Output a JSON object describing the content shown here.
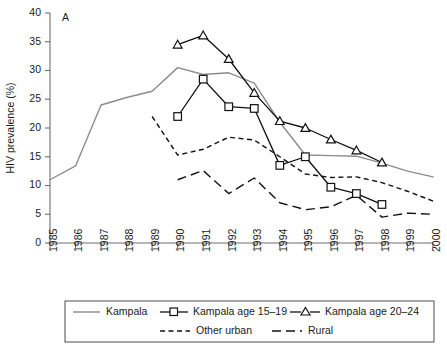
{
  "panel": {
    "label": "A"
  },
  "chart_data": {
    "type": "line",
    "title": "",
    "subtitle": "",
    "xlabel": "",
    "ylabel": "HIV prevalence (%)",
    "xlim": [
      1985,
      2000
    ],
    "ylim": [
      0,
      40
    ],
    "yticks": [
      0,
      5,
      10,
      15,
      20,
      25,
      30,
      35,
      40
    ],
    "ytick_labels": [
      "0",
      "5",
      "10",
      "15",
      "20",
      "25",
      "30",
      "35",
      "40"
    ],
    "xticks": [
      1985,
      1986,
      1987,
      1988,
      1989,
      1990,
      1991,
      1992,
      1993,
      1994,
      1995,
      1996,
      1997,
      1998,
      1999,
      2000
    ],
    "xtick_labels": [
      "1985",
      "1986",
      "1987",
      "1988",
      "1989",
      "1990",
      "1991",
      "1992",
      "1993",
      "1994",
      "1995",
      "1996",
      "1997",
      "1998",
      "1999",
      "2000"
    ],
    "grid": false,
    "legend_position": "bottom",
    "series": [
      {
        "name": "Kampala",
        "style": "solid",
        "color": "#8c8c8c",
        "marker": "none",
        "x": [
          1985,
          1986,
          1987,
          1988,
          1989,
          1990,
          1991,
          1992,
          1993,
          1994,
          1995,
          1996,
          1997,
          1998,
          1999,
          2000
        ],
        "values": [
          11.0,
          13.4,
          24.0,
          25.3,
          26.4,
          30.5,
          29.3,
          29.6,
          27.8,
          21.0,
          15.3,
          15.2,
          15.1,
          13.9,
          12.5,
          11.5
        ]
      },
      {
        "name": "Kampala age 15–19",
        "style": "solid",
        "color": "#111111",
        "marker": "square",
        "x": [
          1990,
          1991,
          1992,
          1993,
          1994,
          1995,
          1996,
          1997,
          1998
        ],
        "values": [
          22.0,
          28.5,
          23.7,
          23.4,
          13.5,
          15.0,
          9.7,
          8.6,
          6.7
        ]
      },
      {
        "name": "Kampala age 20–24",
        "style": "solid",
        "color": "#111111",
        "marker": "triangle",
        "x": [
          1990,
          1991,
          1992,
          1993,
          1994,
          1995,
          1996,
          1997,
          1998
        ],
        "values": [
          34.5,
          36.1,
          32.0,
          26.1,
          21.2,
          20.0,
          18.0,
          16.1,
          14.0
        ]
      },
      {
        "name": "Other urban",
        "style": "dashed-short",
        "color": "#111111",
        "marker": "none",
        "x": [
          1989,
          1990,
          1991,
          1992,
          1993,
          1994,
          1995,
          1996,
          1997,
          1998,
          1999,
          2000
        ],
        "values": [
          22.0,
          15.3,
          16.3,
          18.4,
          17.9,
          15.0,
          12.0,
          11.4,
          11.5,
          10.5,
          9.0,
          7.3
        ]
      },
      {
        "name": "Rural",
        "style": "dashed-long",
        "color": "#111111",
        "marker": "none",
        "x": [
          1990,
          1991,
          1992,
          1993,
          1994,
          1995,
          1996,
          1997,
          1998,
          1999,
          2000
        ],
        "values": [
          11.0,
          12.6,
          8.6,
          11.3,
          7.0,
          5.8,
          6.3,
          8.3,
          4.5,
          5.2,
          5.0
        ]
      }
    ]
  },
  "legend": {
    "entries": [
      {
        "label": "Kampala",
        "key": "kampala"
      },
      {
        "label": "Kampala age 15–19",
        "key": "kampala-15-19"
      },
      {
        "label": "Kampala age 20–24",
        "key": "kampala-20-24"
      },
      {
        "label": "Other urban",
        "key": "other-urban"
      },
      {
        "label": "Rural",
        "key": "rural"
      }
    ]
  }
}
